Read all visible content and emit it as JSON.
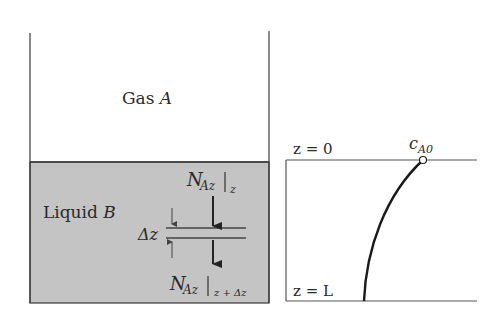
{
  "diagram": {
    "vessel": {
      "gas_label": "Gas",
      "gas_species": "A",
      "liquid_label": "Liquid",
      "liquid_species": "B",
      "liquid_color": "#c4c4c4",
      "line_color": "#3a3a3a"
    },
    "shell": {
      "delta_label": "Δz",
      "flux_in_symbol": "N",
      "flux_in_sub": "Az",
      "flux_in_eval": "z",
      "flux_out_symbol": "N",
      "flux_out_sub": "Az",
      "flux_out_eval": "z + Δz"
    },
    "profile": {
      "top_label": "z = 0",
      "bottom_label": "z = L",
      "point_symbol": "c",
      "point_sub": "A0",
      "curve_color": "#1a1a1a"
    }
  }
}
